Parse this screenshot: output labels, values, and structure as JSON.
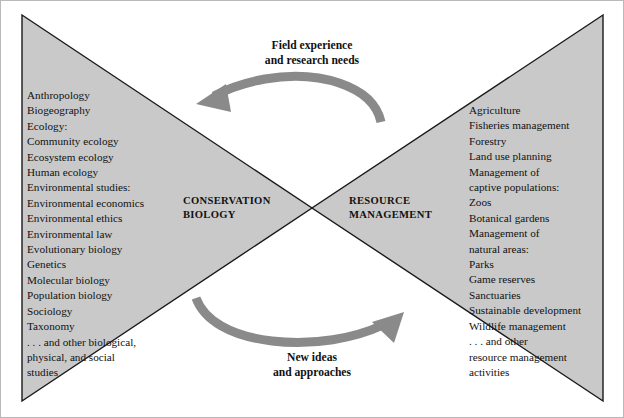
{
  "diagram": {
    "colors": {
      "triangle_fill": "#c9c9c9",
      "triangle_stroke": "#1a1a1a",
      "arrow_fill": "#8a8a8a",
      "frame_border": "#b9b9b9",
      "text": "#111111",
      "background": "#ffffff"
    },
    "center": {
      "left_label": "CONSERVATION\nBIOLOGY",
      "right_label": "RESOURCE\nMANAGEMENT"
    },
    "arrows": {
      "top": {
        "caption": "Field experience\nand research needs",
        "direction": "right-to-left",
        "icon": "curved-arrow-left-icon"
      },
      "bottom": {
        "caption": "New ideas\nand approaches",
        "direction": "left-to-right",
        "icon": "curved-arrow-right-icon"
      }
    },
    "left_column": {
      "name": "conservation-biology-disciplines",
      "items": [
        {
          "text": "Anthropology",
          "indent": 0
        },
        {
          "text": "Biogeography",
          "indent": 0
        },
        {
          "text": "Ecology:",
          "indent": 0
        },
        {
          "text": "Community ecology",
          "indent": 1
        },
        {
          "text": "Ecosystem ecology",
          "indent": 1
        },
        {
          "text": "Human ecology",
          "indent": 1
        },
        {
          "text": "Environmental studies:",
          "indent": 0
        },
        {
          "text": "Environmental economics",
          "indent": 1
        },
        {
          "text": "Environmental ethics",
          "indent": 1
        },
        {
          "text": "Environmental law",
          "indent": 1
        },
        {
          "text": "Evolutionary biology",
          "indent": 0
        },
        {
          "text": "Genetics",
          "indent": 0
        },
        {
          "text": "Molecular biology",
          "indent": 0
        },
        {
          "text": "Population biology",
          "indent": 0
        },
        {
          "text": "Sociology",
          "indent": 0
        },
        {
          "text": "Taxonomy",
          "indent": 0
        },
        {
          "text": ". . . and other biological,",
          "indent": 1
        },
        {
          "text": "physical, and social",
          "indent": 1
        },
        {
          "text": "studies",
          "indent": 1
        }
      ]
    },
    "right_column": {
      "name": "resource-management-fields",
      "items": [
        {
          "text": "Agriculture",
          "indent": 0
        },
        {
          "text": "Fisheries management",
          "indent": 0
        },
        {
          "text": "Forestry",
          "indent": 0
        },
        {
          "text": "Land use planning",
          "indent": 0
        },
        {
          "text": "Management of",
          "indent": 0
        },
        {
          "text": "captive populations:",
          "indent": 0
        },
        {
          "text": "Zoos",
          "indent": 1
        },
        {
          "text": "Botanical gardens",
          "indent": 1
        },
        {
          "text": "Management of",
          "indent": 0
        },
        {
          "text": "natural areas:",
          "indent": 0
        },
        {
          "text": "Parks",
          "indent": 1
        },
        {
          "text": "Game reserves",
          "indent": 1
        },
        {
          "text": "Sanctuaries",
          "indent": 1
        },
        {
          "text": "Sustainable development",
          "indent": 0
        },
        {
          "text": "Wildlife management",
          "indent": 0
        },
        {
          "text": ". . . and other",
          "indent": 1
        },
        {
          "text": "resource management",
          "indent": 1
        },
        {
          "text": "activities",
          "indent": 1
        }
      ]
    }
  }
}
